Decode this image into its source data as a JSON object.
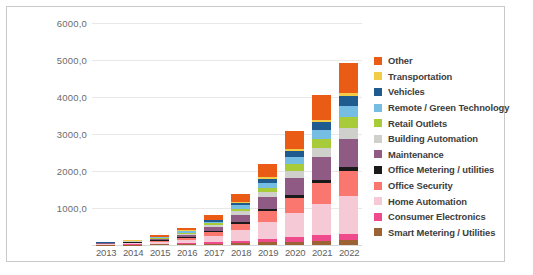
{
  "chart_data": {
    "type": "bar",
    "stacked": true,
    "title": "",
    "xlabel": "",
    "ylabel": "",
    "grid": true,
    "legend_position": "right",
    "ylim": [
      0,
      6000
    ],
    "yticks": [
      "1000,0",
      "2000,0",
      "3000,0",
      "4000,0",
      "5000,0",
      "6000,0"
    ],
    "ytick_values": [
      1000,
      2000,
      3000,
      4000,
      5000,
      6000
    ],
    "categories": [
      "2013",
      "2014",
      "2015",
      "2016",
      "2017",
      "2018",
      "2019",
      "2020",
      "2021",
      "2022"
    ],
    "series": [
      {
        "name": "Smart Metering / Utilities",
        "color": "#9c6233",
        "values": [
          8,
          12,
          18,
          26,
          38,
          55,
          75,
          95,
          115,
          130
        ]
      },
      {
        "name": "Consumer Electronics",
        "color": "#ef4a8c",
        "values": [
          6,
          10,
          16,
          26,
          42,
          66,
          95,
          125,
          150,
          170
        ]
      },
      {
        "name": "Home Automation",
        "color": "#f6c9d6",
        "values": [
          14,
          26,
          48,
          88,
          160,
          280,
          450,
          640,
          840,
          1020
        ]
      },
      {
        "name": "Office Security",
        "color": "#f9776e",
        "values": [
          10,
          18,
          33,
          60,
          105,
          180,
          290,
          420,
          560,
          690
        ]
      },
      {
        "name": "Office Metering / utilities",
        "color": "#1a1a1a",
        "values": [
          3,
          5,
          9,
          15,
          24,
          38,
          55,
          72,
          88,
          100
        ]
      },
      {
        "name": "Maintenance",
        "color": "#8f5b85",
        "values": [
          11,
          20,
          37,
          68,
          120,
          205,
          330,
          470,
          620,
          760
        ]
      },
      {
        "name": "Building Automation",
        "color": "#cfd0cb",
        "values": [
          5,
          9,
          16,
          29,
          50,
          85,
          135,
          190,
          250,
          300
        ]
      },
      {
        "name": "Retail Outlets",
        "color": "#a8cb3a",
        "values": [
          5,
          8,
          15,
          27,
          46,
          78,
          122,
          175,
          230,
          280
        ]
      },
      {
        "name": "Remote / Green Technology",
        "color": "#76bde3",
        "values": [
          5,
          9,
          16,
          29,
          50,
          84,
          132,
          188,
          248,
          300
        ]
      },
      {
        "name": "Vehicles",
        "color": "#1f5b8f",
        "values": [
          4,
          7,
          13,
          24,
          42,
          72,
          115,
          165,
          220,
          270
        ]
      },
      {
        "name": "Transportation",
        "color": "#f2cc46",
        "values": [
          2,
          3,
          5,
          9,
          15,
          25,
          38,
          52,
          66,
          78
        ]
      },
      {
        "name": "Other",
        "color": "#ea5b16",
        "values": [
          12,
          22,
          40,
          74,
          132,
          225,
          358,
          505,
          660,
          820
        ]
      }
    ],
    "totals": [
      85,
      149,
      266,
      475,
      824,
      1393,
      2195,
      3097,
      4047,
      4918
    ]
  },
  "legend": {
    "items": [
      {
        "label": "Other",
        "color": "#ea5b16"
      },
      {
        "label": "Transportation",
        "color": "#f2cc46"
      },
      {
        "label": "Vehicles",
        "color": "#1f5b8f"
      },
      {
        "label": "Remote / Green Technology",
        "color": "#76bde3"
      },
      {
        "label": "Retail Outlets",
        "color": "#a8cb3a"
      },
      {
        "label": "Building Automation",
        "color": "#cfd0cb"
      },
      {
        "label": "Maintenance",
        "color": "#8f5b85"
      },
      {
        "label": "Office Metering / utilities",
        "color": "#1a1a1a"
      },
      {
        "label": "Office Security",
        "color": "#f9776e"
      },
      {
        "label": "Home Automation",
        "color": "#f6c9d6"
      },
      {
        "label": "Consumer Electronics",
        "color": "#ef4a8c"
      },
      {
        "label": "Smart Metering / Utilities",
        "color": "#9c6233"
      }
    ]
  },
  "colors": {
    "grid": "#e8e8e8",
    "axis_text": "#6b6b6b",
    "legend_text": "#3d3d3d",
    "frame": "#c9c9c9",
    "background": "#ffffff"
  }
}
